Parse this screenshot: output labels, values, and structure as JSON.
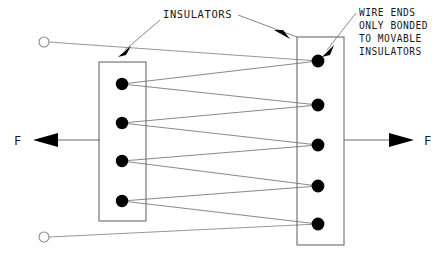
{
  "diagram": {
    "background_color": "#ffffff",
    "line_color": "#6b6b6b",
    "wire_color": "#7a7a7a",
    "dot_color": "#000000",
    "text_color": "#1a1a1a",
    "width": 447,
    "height": 260
  },
  "labels": {
    "insulators": "INSULATORS",
    "note_lines": [
      "WIRE ENDS",
      "ONLY BONDED",
      "TO MOVABLE",
      "INSULATORS"
    ],
    "force_left": "F",
    "force_right": "F"
  },
  "insulator_blocks": [
    {
      "name": "left-insulator",
      "x": 99,
      "y": 62,
      "width": 47,
      "height": 159,
      "bond_count": 4
    },
    {
      "name": "right-insulator",
      "x": 297,
      "y": 37,
      "width": 47,
      "height": 208,
      "bond_count": 5
    }
  ],
  "bond_points": {
    "left": [
      {
        "cx": 122,
        "cy": 84
      },
      {
        "cx": 122,
        "cy": 123
      },
      {
        "cx": 122,
        "cy": 161
      },
      {
        "cx": 122,
        "cy": 201
      }
    ],
    "right": [
      {
        "cx": 318,
        "cy": 61
      },
      {
        "cx": 318,
        "cy": 105
      },
      {
        "cx": 318,
        "cy": 145
      },
      {
        "cx": 318,
        "cy": 186
      },
      {
        "cx": 318,
        "cy": 224
      }
    ]
  },
  "terminals": [
    {
      "name": "top-terminal",
      "cx": 44,
      "cy": 42,
      "r": 5
    },
    {
      "name": "bottom-terminal",
      "cx": 44,
      "cy": 237,
      "r": 5
    }
  ],
  "force_arrows": [
    {
      "name": "force-arrow-left",
      "direction": "left",
      "y": 140,
      "x_tail": 100,
      "x_tip": 33,
      "label_x": 14
    },
    {
      "name": "force-arrow-right",
      "direction": "right",
      "y": 140,
      "x_tail": 344,
      "x_tip": 414,
      "label_x": 424
    }
  ]
}
